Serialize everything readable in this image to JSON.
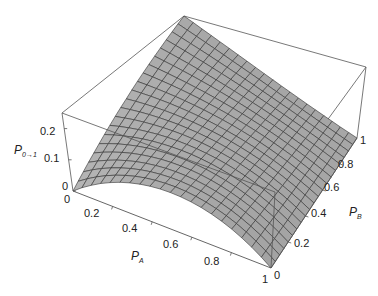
{
  "chart_data": {
    "type": "surface3d",
    "title": "",
    "xlabel": "P_A",
    "ylabel": "P_B",
    "zlabel": "P_{0→1}",
    "axis_titles": {
      "x": {
        "main": "P",
        "sub": "A"
      },
      "y": {
        "main": "P",
        "sub": "B"
      },
      "z": {
        "main": "P",
        "sub": "0→1"
      }
    },
    "x_ticks": [
      "0",
      "0.2",
      "0.4",
      "0.6",
      "0.8",
      "1"
    ],
    "y_ticks": [
      "0",
      "0.2",
      "0.4",
      "0.6",
      "0.8",
      "1"
    ],
    "z_ticks": [
      "0",
      "0.1",
      "0.2"
    ],
    "xlim": [
      0,
      1
    ],
    "ylim": [
      0,
      1
    ],
    "zlim": [
      0,
      0.25
    ],
    "grid": false,
    "box": true,
    "mesh_divisions": 20,
    "surface_color": "#a9a9a9",
    "mesh_color": "#333333",
    "box_color": "#555555",
    "surface_samples": {
      "description": "approximate P_{0→1}(P_A, P_B) values read from the plot",
      "points": [
        {
          "P_A": 0.0,
          "P_B": 0.0,
          "P": 0.0
        },
        {
          "P_A": 0.5,
          "P_B": 0.0,
          "P": 0.12
        },
        {
          "P_A": 1.0,
          "P_B": 0.0,
          "P": 0.0
        },
        {
          "P_A": 0.0,
          "P_B": 1.0,
          "P": 0.25
        },
        {
          "P_A": 0.5,
          "P_B": 1.0,
          "P": 0.08
        },
        {
          "P_A": 1.0,
          "P_B": 1.0,
          "P": 0.0
        },
        {
          "P_A": 0.0,
          "P_B": 0.5,
          "P": 0.13
        },
        {
          "P_A": 0.5,
          "P_B": 0.5,
          "P": 0.1
        }
      ]
    }
  }
}
